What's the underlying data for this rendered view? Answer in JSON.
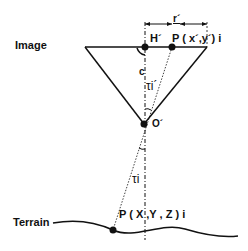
{
  "labels": {
    "image": "Image",
    "terrain": "Terrain",
    "h_prime": "H´",
    "p_image": "P ( x´,y´) i",
    "r_prime": "r´",
    "c": "c",
    "tau_upper": "τi´",
    "o_prime": "O´",
    "tau_lower": "τi",
    "p_terrain": "P ( X ,Y , Z ) i"
  },
  "colors": {
    "line": "#111111",
    "background": "#ffffff"
  }
}
